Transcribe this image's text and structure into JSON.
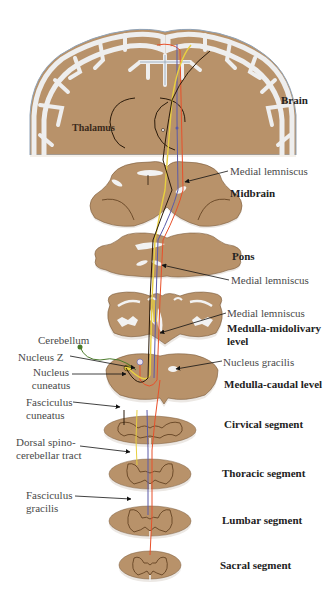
{
  "figure": {
    "colors": {
      "tissue": "#b8926a",
      "tissue_dark": "#7a5a3a",
      "white_matter": "#f2f2f2",
      "outline_blue": "#8fa3b8",
      "tract_red": "#e8502a",
      "tract_blue": "#5a5aa8",
      "tract_yellow": "#e8d040",
      "tract_black": "#2a1a0a",
      "tract_green": "#4a7a2a",
      "label_text": "#4a4a4a",
      "level_text": "#222222"
    }
  },
  "levels": [
    {
      "id": "brain",
      "label": "Brain"
    },
    {
      "id": "midbrain",
      "label": "Midbrain"
    },
    {
      "id": "pons",
      "label": "Pons"
    },
    {
      "id": "medulla_midolivary",
      "label_line1": "Medulla-midolivary",
      "label_line2": "level"
    },
    {
      "id": "medulla_caudal",
      "label": "Medulla-caudal level"
    },
    {
      "id": "cervical",
      "label": "Cirvical segment"
    },
    {
      "id": "thoracic",
      "label": "Thoracic segment"
    },
    {
      "id": "lumbar",
      "label": "Lumbar segment"
    },
    {
      "id": "sacral",
      "label": "Sacral segment"
    }
  ],
  "annotations": {
    "thalamus": "Thalamus",
    "medial_lemniscus_midbrain": "Medial lemniscus",
    "medial_lemniscus_pons": "Medial lemniscus",
    "medial_lemniscus_medulla": "Medial lemniscus",
    "cerebellum": "Cerebellum",
    "nucleus_z": "Nucleus Z",
    "nucleus_cuneatus_line1": "Nucleus",
    "nucleus_cuneatus_line2": "cuneatus",
    "nucleus_gracilis": "Nucleus gracilis",
    "fasciculus_cuneatus_line1": "Fasciculus",
    "fasciculus_cuneatus_line2": "cuneatus",
    "dorsal_spinocerebellar_line1": "Dorsal spino-",
    "dorsal_spinocerebellar_line2": "cerebellar tract",
    "fasciculus_gracilis_line1": "Fasciculus",
    "fasciculus_gracilis_line2": "gracilis"
  }
}
